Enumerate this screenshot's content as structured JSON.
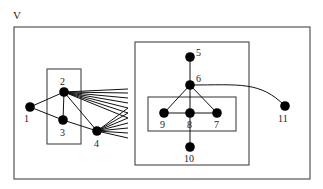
{
  "diagram": {
    "title": "V",
    "colors": {
      "node": "#000000",
      "edge": "#111111",
      "box": "#444444",
      "background": "#ffffff"
    },
    "boxes": [
      {
        "id": "outer",
        "x": 14,
        "y": 27,
        "w": 296,
        "h": 152
      },
      {
        "id": "left-cluster",
        "x": 47,
        "y": 69,
        "w": 34,
        "h": 75
      },
      {
        "id": "right-cluster",
        "x": 135,
        "y": 42,
        "w": 114,
        "h": 123
      },
      {
        "id": "inner-cluster",
        "x": 148,
        "y": 97,
        "w": 88,
        "h": 34
      }
    ],
    "nodes": [
      {
        "id": "1",
        "label": "1",
        "x": 30,
        "y": 107
      },
      {
        "id": "2",
        "label": "2",
        "x": 64,
        "y": 92
      },
      {
        "id": "3",
        "label": "3",
        "x": 63,
        "y": 120
      },
      {
        "id": "4",
        "label": "4",
        "x": 97,
        "y": 131
      },
      {
        "id": "5",
        "label": "5",
        "x": 190,
        "y": 57
      },
      {
        "id": "6",
        "label": "6",
        "x": 190,
        "y": 85
      },
      {
        "id": "7",
        "label": "7",
        "x": 217,
        "y": 113
      },
      {
        "id": "8",
        "label": "8",
        "x": 190,
        "y": 113
      },
      {
        "id": "9",
        "label": "9",
        "x": 164,
        "y": 113
      },
      {
        "id": "10",
        "label": "10",
        "x": 190,
        "y": 147
      },
      {
        "id": "11",
        "label": "11",
        "x": 285,
        "y": 106
      }
    ],
    "edges": [
      [
        "1",
        "2"
      ],
      [
        "1",
        "3"
      ],
      [
        "2",
        "3"
      ],
      [
        "3",
        "4"
      ],
      [
        "2",
        "4"
      ],
      [
        "5",
        "6"
      ],
      [
        "6",
        "9"
      ],
      [
        "6",
        "7"
      ],
      [
        "6",
        "8"
      ],
      [
        "9",
        "8"
      ],
      [
        "8",
        "7"
      ],
      [
        "8",
        "10"
      ]
    ],
    "curved_edges": [
      {
        "from": "6",
        "to": "11"
      }
    ],
    "fan_from_2_endpoints_y": [
      89,
      93,
      98,
      103,
      108,
      113,
      118
    ],
    "fan_from_4_endpoints_y": [
      108,
      113,
      118,
      123,
      128,
      133,
      138
    ],
    "fan_end_x": 128
  }
}
